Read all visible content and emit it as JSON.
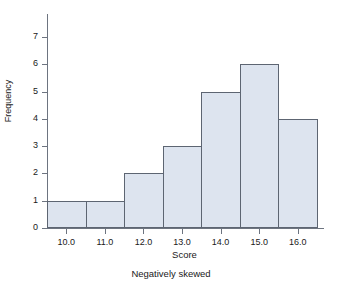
{
  "chart_data": {
    "type": "bar",
    "title": "",
    "subtitle": "",
    "caption": "Negatively skewed",
    "xlabel": "Score",
    "ylabel": "Frequency",
    "categories": [
      "10.0",
      "11.0",
      "12.0",
      "13.0",
      "14.0",
      "15.0",
      "16.0"
    ],
    "values": [
      1,
      1,
      2,
      3,
      5,
      6,
      4
    ],
    "x_tick_labels": [
      "10.0",
      "11.0",
      "12.0",
      "13.0",
      "14.0",
      "15.0",
      "16.0"
    ],
    "y_tick_labels": [
      "0",
      "1",
      "2",
      "3",
      "4",
      "5",
      "6",
      "7"
    ],
    "y_ticks": [
      0,
      1,
      2,
      3,
      4,
      5,
      6,
      7
    ],
    "ylim": [
      0,
      7
    ],
    "xlim": [
      9.5,
      16.5
    ],
    "bin_width": 1.0,
    "grid": false,
    "legend": false,
    "legend_position": "none",
    "bar_fill_color": "#dde4ef",
    "bar_border_color": "#5d6572",
    "axis_color": "#6d7480",
    "background_color": "#ffffff",
    "text_color": "#1a1a1a"
  }
}
